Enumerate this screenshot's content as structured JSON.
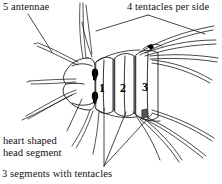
{
  "figure": {
    "kind": "scientific-line-drawing",
    "width": 222,
    "height": 184,
    "background_color": "#ffffff",
    "ink_color": "#1a1a1a",
    "eye_color": "#000000"
  },
  "labels": {
    "antennae": "5 antennae",
    "tentacles_per_side": "4 tentacles per side",
    "head_segment_line1": "heart shaped",
    "head_segment_line2": "head segment",
    "segments_with_tentacles": "3 segments with tentacles"
  },
  "segment_numbers": {
    "one": "1",
    "two": "2",
    "three": "3"
  },
  "anatomy": {
    "antennae_count": 5,
    "tentacles_per_side": 4,
    "numbered_segments": 3,
    "eye_spots": 2,
    "head_shape": "heart shaped"
  }
}
